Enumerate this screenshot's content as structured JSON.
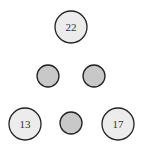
{
  "diagram": {
    "type": "tree",
    "colors": {
      "labeled_fill": "#ececec",
      "empty_fill": "#c8c8c8",
      "stroke": "#222222"
    },
    "nodes": [
      {
        "id": "root",
        "label": "22",
        "cx": 71,
        "cy": 27,
        "r": 16,
        "filled": false
      },
      {
        "id": "mid-left",
        "label": "",
        "cx": 48,
        "cy": 76,
        "r": 11,
        "filled": true
      },
      {
        "id": "mid-right",
        "label": "",
        "cx": 94,
        "cy": 76,
        "r": 11,
        "filled": true
      },
      {
        "id": "bottom-left",
        "label": "13",
        "cx": 25,
        "cy": 124,
        "r": 16,
        "filled": false
      },
      {
        "id": "bottom-middle",
        "label": "",
        "cx": 71,
        "cy": 123,
        "r": 11,
        "filled": true
      },
      {
        "id": "bottom-right",
        "label": "17",
        "cx": 118,
        "cy": 124,
        "r": 16,
        "filled": false
      }
    ]
  }
}
